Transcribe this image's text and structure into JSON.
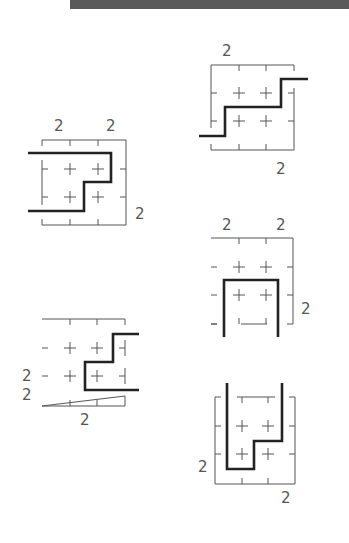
{
  "header": {
    "bar_color": "#5a5a5a"
  },
  "colors": {
    "frame": "#555555",
    "heavy_line": "#222222",
    "label": "#555555"
  },
  "diagrams": [
    {
      "id": "diagram-1",
      "labels": [
        {
          "text": "2",
          "x": 54,
          "y": 131
        },
        {
          "text": "2",
          "x": 106,
          "y": 131
        },
        {
          "text": "2",
          "x": 135,
          "y": 219
        }
      ]
    },
    {
      "id": "diagram-2",
      "labels": [
        {
          "text": "2",
          "x": 222,
          "y": 56
        },
        {
          "text": "2",
          "x": 276,
          "y": 174
        }
      ]
    },
    {
      "id": "diagram-3",
      "labels": [
        {
          "text": "2",
          "x": 22,
          "y": 381
        },
        {
          "text": "2",
          "x": 22,
          "y": 400
        },
        {
          "text": "2",
          "x": 80,
          "y": 425
        }
      ]
    },
    {
      "id": "diagram-4",
      "labels": [
        {
          "text": "2",
          "x": 222,
          "y": 230
        },
        {
          "text": "2",
          "x": 276,
          "y": 230
        },
        {
          "text": "2",
          "x": 301,
          "y": 314
        }
      ]
    },
    {
      "id": "diagram-5",
      "labels": [
        {
          "text": "2",
          "x": 198,
          "y": 472
        },
        {
          "text": "2",
          "x": 281,
          "y": 503
        }
      ]
    }
  ]
}
